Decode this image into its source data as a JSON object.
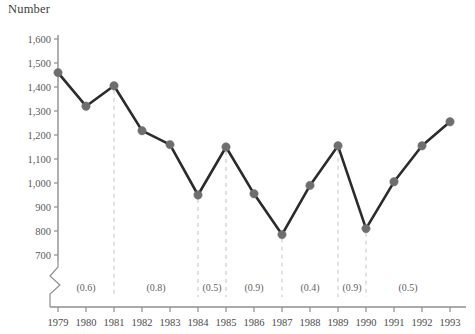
{
  "chart_data": {
    "type": "line",
    "title": "Number",
    "xlabel": "",
    "ylabel": "",
    "grid": false,
    "legend": false,
    "axis_break": true,
    "ylim": [
      700,
      1600
    ],
    "ytick_step": 100,
    "ytick_labels": [
      "1,600",
      "1,500",
      "1,400",
      "1,300",
      "1,200",
      "1,100",
      "1,000",
      "900",
      "800",
      "700"
    ],
    "ytick_values": [
      1600,
      1500,
      1400,
      1300,
      1200,
      1100,
      1000,
      900,
      800,
      700
    ],
    "categories": [
      "1979",
      "1980",
      "1981",
      "1982",
      "1983",
      "1984",
      "1985",
      "1986",
      "1987",
      "1988",
      "1989",
      "1990",
      "1991",
      "1992",
      "1993"
    ],
    "x": [
      1979,
      1980,
      1981,
      1982,
      1983,
      1984,
      1985,
      1986,
      1987,
      1988,
      1989,
      1990,
      1991,
      1992,
      1993
    ],
    "values": [
      1460,
      1320,
      1405,
      1218,
      1160,
      950,
      1150,
      955,
      785,
      990,
      1155,
      810,
      1005,
      1155,
      1255
    ],
    "series": [
      {
        "name": "Number",
        "values": [
          1460,
          1320,
          1405,
          1218,
          1160,
          950,
          1150,
          955,
          785,
          990,
          1155,
          810,
          1005,
          1155,
          1255
        ]
      }
    ],
    "segment_annotations": [
      {
        "label": "(0.6)",
        "start": 1979,
        "end": 1981
      },
      {
        "label": "(0.8)",
        "start": 1981,
        "end": 1984
      },
      {
        "label": "(0.5)",
        "start": 1984,
        "end": 1985
      },
      {
        "label": "(0.9)",
        "start": 1985,
        "end": 1987
      },
      {
        "label": "(0.4)",
        "start": 1987,
        "end": 1989
      },
      {
        "label": "(0.9)",
        "start": 1989,
        "end": 1990
      },
      {
        "label": "(0.5)",
        "start": 1990,
        "end": 1993
      }
    ],
    "dashed_markers": [
      1981,
      1984,
      1985,
      1987,
      1989,
      1990
    ],
    "colors": {
      "line": "#2b2b2b",
      "marker": "#6e6e6e",
      "axis": "#8f8f8f",
      "dashed": "#c4c4c4",
      "text": "#4a4a4a"
    }
  }
}
